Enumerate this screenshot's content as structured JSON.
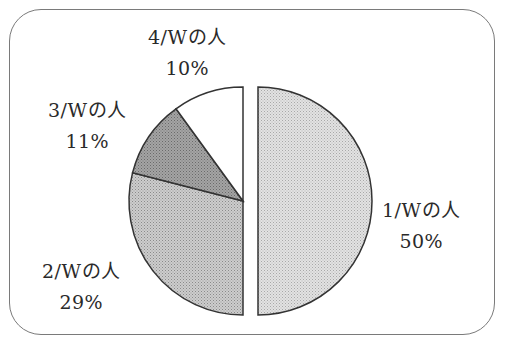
{
  "chart_data": {
    "type": "pie",
    "title": "",
    "categories": [
      "1/Wの人",
      "2/Wの人",
      "3/Wの人",
      "4/Wの人"
    ],
    "values": [
      50,
      29,
      11,
      10
    ],
    "value_labels": [
      "50%",
      "29%",
      "11%",
      "10%"
    ],
    "exploded": [
      true,
      false,
      false,
      false
    ],
    "legend": "none (labels placed beside slices)",
    "slice_fills": [
      "#d8d8d8",
      "#c4c4c4",
      "#9a9a9a",
      "#ffffff"
    ]
  },
  "labels": [
    {
      "name": "1/Wの人",
      "pct": "50%"
    },
    {
      "name": "2/Wの人",
      "pct": "29%"
    },
    {
      "name": "3/Wの人",
      "pct": "11%"
    },
    {
      "name": "4/Wの人",
      "pct": "10%"
    }
  ]
}
